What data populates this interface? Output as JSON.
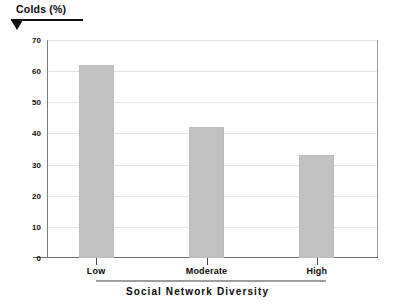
{
  "chart_data": {
    "type": "bar",
    "title": "",
    "categories": [
      "Low",
      "Moderate",
      "High"
    ],
    "values": [
      62,
      42,
      33
    ],
    "series": [
      {
        "name": "Colds (%)",
        "values": [
          62,
          42,
          33
        ]
      }
    ],
    "xlabel": "Social Network Diversity",
    "ylabel": "Colds (%)",
    "ylim": [
      0,
      70
    ],
    "yticks": [
      0,
      10,
      20,
      30,
      40,
      50,
      60,
      70
    ],
    "ytick_labels": [
      "0",
      "10",
      "20",
      "30",
      "40",
      "50",
      "60",
      "70"
    ],
    "grid": true,
    "legend": false,
    "legend_position": "none",
    "bar_color": "#c2c2c2",
    "axis_color": "#6e6e6e",
    "grid_color": "#e3e3e3",
    "text_color": "#0a0a0a",
    "background": "#ffffff"
  },
  "axes": {
    "y_title": "Colds (%)",
    "x_title": "Social Network Diversity"
  }
}
